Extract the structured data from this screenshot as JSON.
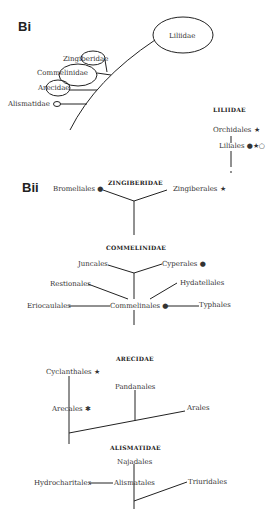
{
  "panels": {
    "bi": {
      "label": "Bi"
    },
    "bii": {
      "label": "Bii"
    }
  },
  "bi": {
    "subclasses": [
      "Liliidae",
      "Zingiberidae",
      "Commelinidae",
      "Arecidae",
      "Alismatidae"
    ]
  },
  "liliidae": {
    "title": "LILIIDAE",
    "orders": [
      "Orchidales ★",
      "Liliales ●★○"
    ]
  },
  "zingiberidae": {
    "title": "ZINGIBERIDAE",
    "orders": [
      "Bromeliales ●",
      "Zingiberales ★"
    ]
  },
  "commelinidae": {
    "title": "COMMELINIDAE",
    "orders": [
      "Juncales",
      "Cyperales ●",
      "Restionales",
      "Hydatellales",
      "Eriocaulales",
      "Commelinales ●",
      "Typhales"
    ]
  },
  "arecidae": {
    "title": "ARECIDAE",
    "orders": [
      "Cyclanthales ★",
      "Pandanales",
      "Arecales ✱",
      "Arales"
    ]
  },
  "alismatidae": {
    "title": "ALISMATIDAE",
    "orders": [
      "Najadales",
      "Hydrocharitales",
      "Alismatales",
      "Triuridales"
    ]
  },
  "legend_symbols": {
    "filled_circle": "●",
    "star": "★",
    "open_circle": "○"
  }
}
